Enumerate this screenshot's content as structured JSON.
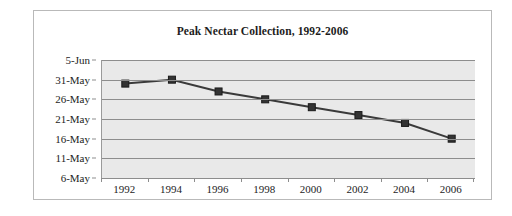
{
  "chart_data": {
    "type": "line",
    "title": "Peak Nectar Collection, 1992-2006",
    "xlabel": "",
    "ylabel": "",
    "grid": true,
    "legend": false,
    "categories": [
      1992,
      1994,
      1996,
      1998,
      2000,
      2002,
      2004,
      2006
    ],
    "x_tick_labels": [
      "1992",
      "1994",
      "1996",
      "1998",
      "2000",
      "2002",
      "2004",
      "2006"
    ],
    "y_tick_labels": [
      "6-May",
      "11-May",
      "16-May",
      "21-May",
      "26-May",
      "31-May",
      "5-Jun"
    ],
    "y_tick_values": [
      0,
      5,
      10,
      15,
      20,
      25,
      30
    ],
    "ylim": [
      0,
      30
    ],
    "y_axis_note": "Day of peak nectar collection; value = days after 6-May",
    "values": [
      24,
      25,
      22,
      20,
      18,
      16,
      14,
      10
    ],
    "value_labels": [
      "30-May",
      "31-May",
      "28-May",
      "26-May",
      "24-May",
      "22-May",
      "20-May",
      "16-May"
    ],
    "series": [
      {
        "name": "Peak Nectar Collection",
        "values": [
          24,
          25,
          22,
          20,
          18,
          16,
          14,
          10
        ]
      }
    ],
    "marker": "square",
    "line_color": "#3a3a3a",
    "marker_color": "#333333",
    "plot_background": "#e9e9e9",
    "gridline_color": "#8d8d8d"
  }
}
